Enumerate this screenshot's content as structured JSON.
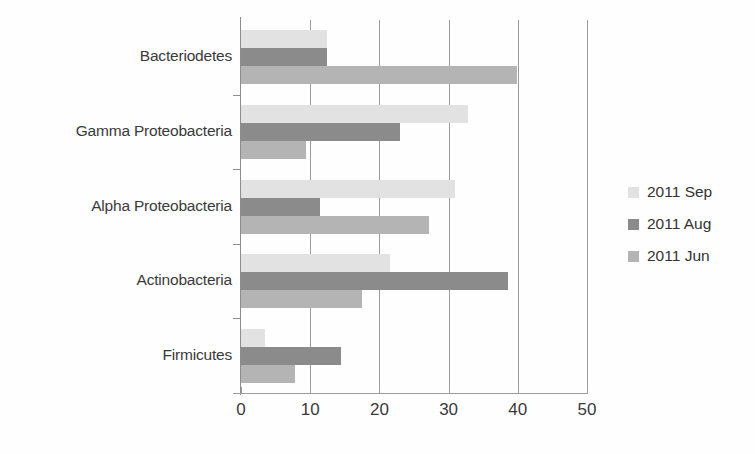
{
  "chart_data": {
    "type": "bar",
    "orientation": "horizontal",
    "title": "",
    "xlabel": "",
    "ylabel": "",
    "xlim": [
      0,
      50
    ],
    "xticks": [
      0,
      10,
      20,
      30,
      40,
      50
    ],
    "xtick_labels": [
      "0",
      "10",
      "20",
      "30",
      "40",
      "50"
    ],
    "grid": "vertical",
    "legend_position": "right",
    "categories": [
      "Bacteriodetes",
      "Gamma Proteobacteria",
      "Alpha Proteobacteria",
      "Actinobacteria",
      "Firmicutes"
    ],
    "series": [
      {
        "name": "2011 Sep",
        "color": "#e2e2e2",
        "values": [
          12.4,
          32.8,
          30.9,
          21.5,
          3.4
        ]
      },
      {
        "name": "2011 Aug",
        "color": "#8b8b8b",
        "values": [
          12.4,
          23.0,
          11.4,
          38.6,
          14.4
        ]
      },
      {
        "name": "2011 Jun",
        "color": "#b4b4b4",
        "values": [
          39.9,
          9.4,
          27.2,
          17.5,
          7.8
        ]
      }
    ]
  },
  "legend": {
    "entries": [
      {
        "label": "2011 Sep",
        "color": "#e2e2e2"
      },
      {
        "label": "2011 Aug",
        "color": "#8b8b8b"
      },
      {
        "label": "2011 Jun",
        "color": "#b4b4b4"
      }
    ]
  }
}
